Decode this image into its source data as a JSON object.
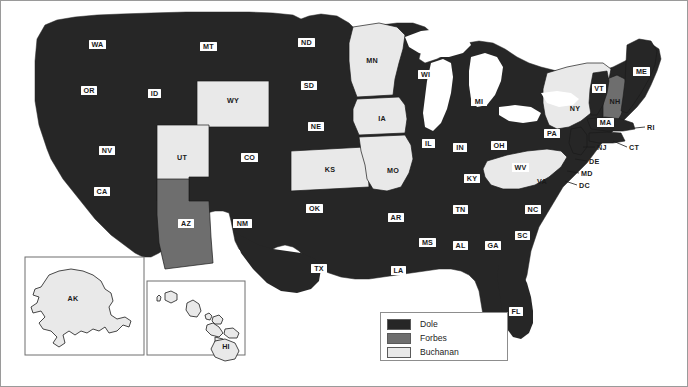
{
  "map": {
    "title": "United States presidential primary results map",
    "colors": {
      "dole": "#262626",
      "forbes": "#6e6e6e",
      "buchanan": "#e9e9e9",
      "water": "#ffffff",
      "outline": "#1a1a1a",
      "frame": "#9a9a9a",
      "label_box": "#ffffff",
      "label_text": "#1a1a1a"
    },
    "legend": {
      "items": [
        {
          "label": "Dole",
          "color": "#262626"
        },
        {
          "label": "Forbes",
          "color": "#6e6e6e"
        },
        {
          "label": "Buchanan",
          "color": "#e9e9e9"
        }
      ]
    },
    "inset_labels": {
      "alaska": "AK",
      "hawaii": "HI"
    },
    "states": [
      {
        "code": "WA",
        "winner": "Dole",
        "label_style": "box"
      },
      {
        "code": "OR",
        "winner": "Dole",
        "label_style": "box"
      },
      {
        "code": "ID",
        "winner": "Dole",
        "label_style": "box"
      },
      {
        "code": "MT",
        "winner": "Dole",
        "label_style": "box"
      },
      {
        "code": "WY",
        "winner": "Buchanan",
        "label_style": "plain"
      },
      {
        "code": "NV",
        "winner": "Dole",
        "label_style": "box"
      },
      {
        "code": "UT",
        "winner": "Buchanan",
        "label_style": "plain"
      },
      {
        "code": "CA",
        "winner": "Dole",
        "label_style": "box"
      },
      {
        "code": "AZ",
        "winner": "Forbes",
        "label_style": "box"
      },
      {
        "code": "CO",
        "winner": "Dole",
        "label_style": "box"
      },
      {
        "code": "NM",
        "winner": "Dole",
        "label_style": "box"
      },
      {
        "code": "ND",
        "winner": "Dole",
        "label_style": "box"
      },
      {
        "code": "SD",
        "winner": "Dole",
        "label_style": "box"
      },
      {
        "code": "NE",
        "winner": "Dole",
        "label_style": "box"
      },
      {
        "code": "KS",
        "winner": "Buchanan",
        "label_style": "plain"
      },
      {
        "code": "OK",
        "winner": "Dole",
        "label_style": "box"
      },
      {
        "code": "TX",
        "winner": "Dole",
        "label_style": "box"
      },
      {
        "code": "MN",
        "winner": "Buchanan",
        "label_style": "plain"
      },
      {
        "code": "IA",
        "winner": "Buchanan",
        "label_style": "plain"
      },
      {
        "code": "MO",
        "winner": "Buchanan",
        "label_style": "plain"
      },
      {
        "code": "AR",
        "winner": "Dole",
        "label_style": "box"
      },
      {
        "code": "LA",
        "winner": "Dole",
        "label_style": "box"
      },
      {
        "code": "MS",
        "winner": "Dole",
        "label_style": "box"
      },
      {
        "code": "AL",
        "winner": "Dole",
        "label_style": "box"
      },
      {
        "code": "GA",
        "winner": "Dole",
        "label_style": "box"
      },
      {
        "code": "FL",
        "winner": "Dole",
        "label_style": "box"
      },
      {
        "code": "WI",
        "winner": "Dole",
        "label_style": "box"
      },
      {
        "code": "IL",
        "winner": "Dole",
        "label_style": "box"
      },
      {
        "code": "MI",
        "winner": "Dole",
        "label_style": "box"
      },
      {
        "code": "IN",
        "winner": "Dole",
        "label_style": "box"
      },
      {
        "code": "OH",
        "winner": "Dole",
        "label_style": "box"
      },
      {
        "code": "KY",
        "winner": "Dole",
        "label_style": "box"
      },
      {
        "code": "TN",
        "winner": "Dole",
        "label_style": "box"
      },
      {
        "code": "WV",
        "winner": "Dole",
        "label_style": "box"
      },
      {
        "code": "VA",
        "winner": "Buchanan",
        "label_style": "plain"
      },
      {
        "code": "NC",
        "winner": "Dole",
        "label_style": "box"
      },
      {
        "code": "SC",
        "winner": "Dole",
        "label_style": "box"
      },
      {
        "code": "PA",
        "winner": "Dole",
        "label_style": "box"
      },
      {
        "code": "NY",
        "winner": "Buchanan",
        "label_style": "plain"
      },
      {
        "code": "VT",
        "winner": "Dole",
        "label_style": "box"
      },
      {
        "code": "NH",
        "winner": "Forbes",
        "label_style": "plain"
      },
      {
        "code": "ME",
        "winner": "Dole",
        "label_style": "box"
      },
      {
        "code": "MA",
        "winner": "Dole",
        "label_style": "box"
      },
      {
        "code": "RI",
        "winner": "Dole",
        "label_style": "leader"
      },
      {
        "code": "CT",
        "winner": "Dole",
        "label_style": "leader"
      },
      {
        "code": "NJ",
        "winner": "Dole",
        "label_style": "leader"
      },
      {
        "code": "DE",
        "winner": "Dole",
        "label_style": "leader"
      },
      {
        "code": "MD",
        "winner": "Dole",
        "label_style": "leader"
      },
      {
        "code": "DC",
        "winner": "Dole",
        "label_style": "leader"
      },
      {
        "code": "AK",
        "winner": "Buchanan",
        "label_style": "plain"
      },
      {
        "code": "HI",
        "winner": "Buchanan",
        "label_style": "plain"
      }
    ]
  }
}
